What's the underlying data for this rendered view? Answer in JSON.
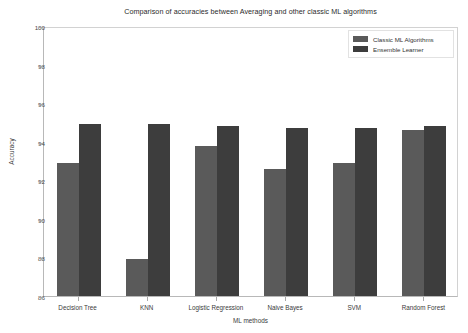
{
  "chart_data": {
    "type": "bar",
    "title": "Comparison of accuracies between Averaging and other classic ML algorithms",
    "xlabel": "ML methods",
    "ylabel": "Accuracy",
    "categories": [
      "Decision Tree",
      "KNN",
      "Logistic Regression",
      "Naive Bayes",
      "SVM",
      "Random Forest"
    ],
    "series": [
      {
        "name": "Classic ML Algorithms",
        "color": "#5a5a5a",
        "values": [
          92.9,
          87.9,
          93.8,
          92.6,
          92.9,
          94.6
        ]
      },
      {
        "name": "Ensemble Learner",
        "color": "#3d3d3d",
        "values": [
          94.9,
          94.9,
          94.8,
          94.7,
          94.7,
          94.8
        ]
      }
    ],
    "ylim": [
      86,
      100
    ],
    "yticks": [
      86,
      88,
      90,
      92,
      94,
      96,
      98,
      100
    ],
    "ytick_labels": [
      "86",
      "88",
      "90",
      "92",
      "94",
      "96",
      "98",
      "100"
    ],
    "grid": false,
    "legend_position": "upper right"
  },
  "legend": {
    "entries": [
      {
        "label": "Classic ML Algorithms"
      },
      {
        "label": "Ensemble Learner"
      }
    ]
  }
}
